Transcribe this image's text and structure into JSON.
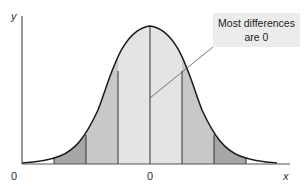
{
  "diagram": {
    "type": "normal-distribution",
    "y_axis_label": "y",
    "x_axis_label": "x",
    "origin_label": "0",
    "center_label": "0",
    "callout_line1": "Most differences",
    "callout_line2": "are 0",
    "band_colors": {
      "inner": "#e4e4e4",
      "middle": "#c8c8c8",
      "outer": "#a6a6a6"
    },
    "curve_color": "#1a1a1a"
  }
}
